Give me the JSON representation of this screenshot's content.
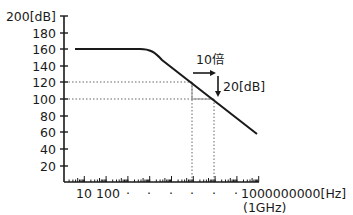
{
  "chart_data": {
    "type": "line",
    "title": "",
    "xlabel": "[Hz]",
    "ylabel": "[dB]",
    "x_scale": "log",
    "xlim": [
      1,
      1000000000
    ],
    "ylim": [
      0,
      200
    ],
    "grid": false,
    "legend": null,
    "y_ticks": [
      {
        "value": 200,
        "label": "200[dB]"
      },
      {
        "value": 180,
        "label": "180"
      },
      {
        "value": 160,
        "label": "160"
      },
      {
        "value": 140,
        "label": "140"
      },
      {
        "value": 120,
        "label": "120"
      },
      {
        "value": 100,
        "label": "100"
      },
      {
        "value": 80,
        "label": "80"
      },
      {
        "value": 60,
        "label": "60"
      },
      {
        "value": 40,
        "label": "40"
      },
      {
        "value": 20,
        "label": "20"
      }
    ],
    "x_tick_labels": [
      {
        "value": 10,
        "label": "10"
      },
      {
        "value": 100,
        "label": "100"
      },
      {
        "value": 1000,
        "label": "·"
      },
      {
        "value": 10000,
        "label": "·"
      },
      {
        "value": 100000,
        "label": "·"
      },
      {
        "value": 1000000,
        "label": "·"
      },
      {
        "value": 10000000,
        "label": "·"
      },
      {
        "value": 100000000,
        "label": "·"
      },
      {
        "value": 1000000000,
        "label": "1000000000[Hz]",
        "sublabel": "(1GHz)"
      }
    ],
    "series": [
      {
        "name": "gain",
        "points": [
          {
            "x": 2,
            "y": 160
          },
          {
            "x": 1000,
            "y": 160
          },
          {
            "x": 10000,
            "y": 150
          },
          {
            "x": 100000,
            "y": 130
          },
          {
            "x": 1000000,
            "y": 120
          },
          {
            "x": 10000000,
            "y": 100
          },
          {
            "x": 1000000000,
            "y": 60
          }
        ],
        "slope": "-20 dB/decade"
      }
    ],
    "annotations": [
      {
        "type": "reference-line",
        "y": 120,
        "x_to": 1000000,
        "style": "dotted"
      },
      {
        "type": "reference-line",
        "y": 100,
        "x_to": 10000000,
        "style": "dotted"
      },
      {
        "type": "reference-line",
        "x": 1000000,
        "y_to": 120,
        "style": "dotted"
      },
      {
        "type": "reference-line",
        "x": 10000000,
        "y_to": 100,
        "style": "dotted"
      },
      {
        "type": "arrow",
        "direction": "right",
        "label": "10倍"
      },
      {
        "type": "arrow",
        "direction": "down",
        "label": "20[dB]"
      }
    ]
  },
  "labels": {
    "y200": "200[dB]",
    "y180": "180",
    "y160": "160",
    "y140": "140",
    "y120": "120",
    "y100": "100",
    "y80": "80",
    "y60": "60",
    "y40": "40",
    "y20": "20",
    "x10": "10",
    "x100": "100",
    "dot": "·",
    "xmax": "1000000000[Hz]",
    "xmax_sub": "(1GHz)",
    "anno_decade": "10倍",
    "anno_db": "20[dB]"
  }
}
